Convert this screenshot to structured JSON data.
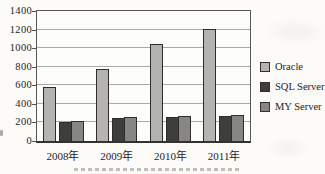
{
  "chart_data": {
    "type": "bar",
    "categories": [
      "2008年",
      "2009年",
      "2010年",
      "2011年"
    ],
    "series": [
      {
        "name": "Oracle",
        "values": [
          580,
          780,
          1040,
          1210
        ],
        "color": "#b4b3b0"
      },
      {
        "name": "SQL Server",
        "values": [
          210,
          245,
          255,
          275
        ],
        "color": "#3e3e3c"
      },
      {
        "name": "MY Server",
        "values": [
          215,
          255,
          265,
          285
        ],
        "color": "#878683"
      }
    ],
    "title": "",
    "xlabel": "",
    "ylabel": "",
    "ylim": [
      0,
      1400
    ],
    "ytick_step": 200,
    "ytick_labels": [
      "0",
      "200",
      "400",
      "600",
      "800",
      "1000",
      "1200",
      "1400"
    ],
    "grid": true,
    "legend_position": "right",
    "colors": {
      "bar_border": "#2f2d2a",
      "gridline": "#aba9a4",
      "axis": "#5a5854",
      "text": "#25241f",
      "paper": "#fcfbf8"
    }
  }
}
